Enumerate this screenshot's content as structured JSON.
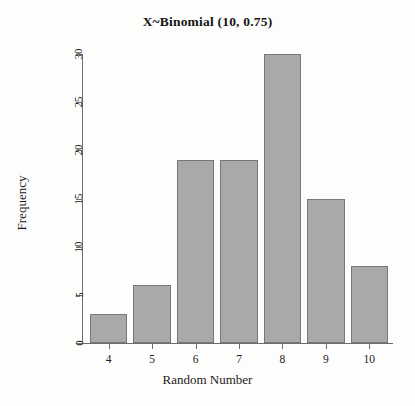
{
  "chart_data": {
    "type": "bar",
    "title": "X~Binomial (10, 0.75)",
    "xlabel": "Random Number",
    "ylabel": "Frequency",
    "categories": [
      "4",
      "5",
      "6",
      "7",
      "8",
      "9",
      "10"
    ],
    "values": [
      3,
      6,
      19,
      19,
      30,
      15,
      8
    ],
    "xlim": [
      3.5,
      10.5
    ],
    "ylim": [
      0,
      30
    ],
    "yticks": [
      0,
      5,
      10,
      15,
      20,
      25,
      30
    ],
    "ytick_labels": [
      "0",
      "5",
      "10",
      "15",
      "20",
      "25",
      "30"
    ],
    "xtick_labels": [
      "4",
      "5",
      "6",
      "7",
      "8",
      "9",
      "10"
    ],
    "grid": false,
    "legend": false,
    "bar_fill_color": "#a9a9a9",
    "bar_border_color": "#787878",
    "axis_color": "#6e6e6e",
    "background_color": "#fdfdfc"
  }
}
